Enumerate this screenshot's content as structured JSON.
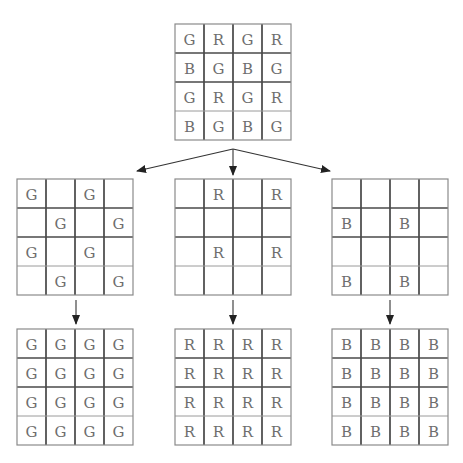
{
  "diagram": {
    "cell_size": 29,
    "grids": [
      {
        "id": "bayer-mosaic",
        "x": 175,
        "y": 24,
        "cells": [
          [
            "G",
            "R",
            "G",
            "R"
          ],
          [
            "B",
            "G",
            "B",
            "G"
          ],
          [
            "G",
            "R",
            "G",
            "R"
          ],
          [
            "B",
            "G",
            "B",
            "G"
          ]
        ]
      },
      {
        "id": "green-sampled",
        "x": 17,
        "y": 179,
        "cells": [
          [
            "G",
            "",
            "G",
            ""
          ],
          [
            "",
            "G",
            "",
            "G"
          ],
          [
            "G",
            "",
            "G",
            ""
          ],
          [
            "",
            "G",
            "",
            "G"
          ]
        ]
      },
      {
        "id": "red-sampled",
        "x": 175,
        "y": 179,
        "cells": [
          [
            "",
            "R",
            "",
            "R"
          ],
          [
            "",
            "",
            "",
            ""
          ],
          [
            "",
            "R",
            "",
            "R"
          ],
          [
            "",
            "",
            "",
            ""
          ]
        ]
      },
      {
        "id": "blue-sampled",
        "x": 332,
        "y": 179,
        "cells": [
          [
            "",
            "",
            "",
            ""
          ],
          [
            "B",
            "",
            "B",
            ""
          ],
          [
            "",
            "",
            "",
            ""
          ],
          [
            "B",
            "",
            "B",
            ""
          ]
        ]
      },
      {
        "id": "green-full",
        "x": 17,
        "y": 329,
        "cells": [
          [
            "G",
            "G",
            "G",
            "G"
          ],
          [
            "G",
            "G",
            "G",
            "G"
          ],
          [
            "G",
            "G",
            "G",
            "G"
          ],
          [
            "G",
            "G",
            "G",
            "G"
          ]
        ]
      },
      {
        "id": "red-full",
        "x": 175,
        "y": 329,
        "cells": [
          [
            "R",
            "R",
            "R",
            "R"
          ],
          [
            "R",
            "R",
            "R",
            "R"
          ],
          [
            "R",
            "R",
            "R",
            "R"
          ],
          [
            "R",
            "R",
            "R",
            "R"
          ]
        ]
      },
      {
        "id": "blue-full",
        "x": 332,
        "y": 329,
        "cells": [
          [
            "B",
            "B",
            "B",
            "B"
          ],
          [
            "B",
            "B",
            "B",
            "B"
          ],
          [
            "B",
            "B",
            "B",
            "B"
          ],
          [
            "B",
            "B",
            "B",
            "B"
          ]
        ]
      }
    ],
    "arrows": [
      {
        "id": "arrow-to-green",
        "x1": 233,
        "y1": 149,
        "x2": 137,
        "y2": 171
      },
      {
        "id": "arrow-to-red",
        "x1": 233,
        "y1": 149,
        "x2": 233,
        "y2": 175
      },
      {
        "id": "arrow-to-blue",
        "x1": 233,
        "y1": 149,
        "x2": 330,
        "y2": 171
      },
      {
        "id": "arrow-green-interp",
        "x1": 76,
        "y1": 300,
        "x2": 76,
        "y2": 324
      },
      {
        "id": "arrow-red-interp",
        "x1": 233,
        "y1": 300,
        "x2": 233,
        "y2": 324
      },
      {
        "id": "arrow-blue-interp",
        "x1": 390,
        "y1": 300,
        "x2": 390,
        "y2": 324
      }
    ],
    "colors": {
      "outer_border": "#8a8a8a",
      "inner_line": "#3a3a3a",
      "text": "#6e6e6e",
      "arrow": "#222222",
      "background": "#ffffff"
    }
  }
}
